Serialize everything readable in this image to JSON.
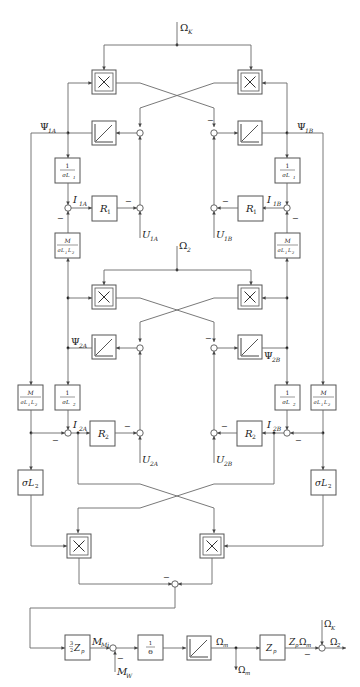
{
  "diagram": {
    "inputs": {
      "omega_k_top": "Ω",
      "omega_k_top_sub": "K",
      "omega_2_mid": "Ω",
      "omega_2_mid_sub": "2",
      "u_1a": "U",
      "u_1a_sub": "1A",
      "u_1b": "U",
      "u_1b_sub": "1B",
      "u_2a": "U",
      "u_2a_sub": "2A",
      "u_2b": "U",
      "u_2b_sub": "2B",
      "m_w": "M",
      "m_w_sub": "W",
      "omega_k_bottom": "Ω",
      "omega_k_bottom_sub": "K"
    },
    "signals": {
      "psi_1a": "Ψ",
      "psi_1a_sub": "1A",
      "psi_1b": "Ψ",
      "psi_1b_sub": "1B",
      "psi_2a": "Ψ",
      "psi_2a_sub": "2A",
      "psi_2b": "Ψ",
      "psi_2b_sub": "2B",
      "i_1a": "I",
      "i_1a_sub": "1A",
      "i_1b": "I",
      "i_1b_sub": "1B",
      "i_2a": "I",
      "i_2a_sub": "2A",
      "i_2b": "I",
      "i_2b_sub": "2B",
      "m_mi": "M",
      "m_mi_sub": "Mi",
      "omega_m": "Ω",
      "omega_m_sub": "m",
      "omega_m_out": "Ω",
      "omega_m_out_sub": "m",
      "zp_omega_m": "Z",
      "zp_omega_m_sub": "p",
      "zp_omega_m_tail": "Ω",
      "zp_omega_m_tail_sub": "m",
      "omega_2_out": "Ω",
      "omega_2_out_sub": "2"
    },
    "blocks": {
      "multiplier_symbol": "×",
      "r1": "R",
      "r1_sub": "1",
      "r2": "R",
      "r2_sub": "2",
      "inv_sigma_l1_num": "1",
      "inv_sigma_l1_den": "σL",
      "inv_sigma_l1_den_sub": "1",
      "inv_sigma_l2_num": "1",
      "inv_sigma_l2_den": "σL",
      "inv_sigma_l2_den_sub": "2",
      "m_sigma_num": "M",
      "m_sigma_den": "σL",
      "m_sigma_den_sub1": "1",
      "m_sigma_den_mid": "L",
      "m_sigma_den_sub2": "2",
      "sigma_l2": "σL",
      "sigma_l2_sub": "2",
      "torque_gain_frac_num": "3",
      "torque_gain_frac_den": "2",
      "torque_gain": "Z",
      "torque_gain_sub": "p",
      "inertia_num": "1",
      "inertia_den": "Θ",
      "zp": "Z",
      "zp_sub": "p"
    },
    "sign_marker": "−"
  }
}
